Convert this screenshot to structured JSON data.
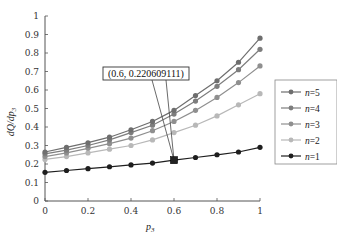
{
  "chart_data": {
    "type": "line",
    "title": "",
    "xlabel": "p3",
    "ylabel": "dQ/dp3",
    "xlim": [
      0,
      1
    ],
    "ylim": [
      0,
      1
    ],
    "x_ticks": [
      "0",
      "0.2",
      "0.4",
      "0.6",
      "0.8",
      "1"
    ],
    "y_ticks": [
      "0",
      "0.1",
      "0.2",
      "0.3",
      "0.4",
      "0.5",
      "0.6",
      "0.7",
      "0.8",
      "0.9",
      "1"
    ],
    "grid": false,
    "legend_position": "right",
    "x": [
      0,
      0.1,
      0.2,
      0.3,
      0.4,
      0.5,
      0.6,
      0.7,
      0.8,
      0.9,
      1.0
    ],
    "series": [
      {
        "name": "n=5",
        "color": "#6e6e6e",
        "values": [
          0.265,
          0.29,
          0.315,
          0.345,
          0.385,
          0.43,
          0.49,
          0.57,
          0.65,
          0.75,
          0.88
        ]
      },
      {
        "name": "n=4",
        "color": "#7d7d7d",
        "values": [
          0.255,
          0.275,
          0.3,
          0.33,
          0.37,
          0.41,
          0.47,
          0.54,
          0.62,
          0.71,
          0.82
        ]
      },
      {
        "name": "n=3",
        "color": "#8f8f8f",
        "values": [
          0.24,
          0.26,
          0.285,
          0.31,
          0.34,
          0.38,
          0.43,
          0.49,
          0.56,
          0.64,
          0.73
        ]
      },
      {
        "name": "n=2",
        "color": "#b8b8b8",
        "values": [
          0.225,
          0.24,
          0.26,
          0.28,
          0.3,
          0.33,
          0.37,
          0.41,
          0.46,
          0.52,
          0.58
        ]
      },
      {
        "name": "n=1",
        "color": "#1e1e1e",
        "values": [
          0.155,
          0.165,
          0.175,
          0.185,
          0.195,
          0.205,
          0.2206,
          0.235,
          0.25,
          0.265,
          0.29
        ]
      }
    ],
    "annotations": [
      {
        "text": "(0.6, 0.220609111)",
        "x": 0.6,
        "y": 0.220609111,
        "series": "n=1",
        "marker": "square"
      }
    ]
  },
  "legend": {
    "items": [
      {
        "label": "n=5",
        "n": "n",
        "eq": "=5"
      },
      {
        "label": "n=4",
        "n": "n",
        "eq": "=4"
      },
      {
        "label": "n=3",
        "n": "n",
        "eq": "=3"
      },
      {
        "label": "n=2",
        "n": "n",
        "eq": "=2"
      },
      {
        "label": "n=1",
        "n": "n",
        "eq": "=1"
      }
    ]
  },
  "axes": {
    "xlabel_main": "p",
    "xlabel_sub": "3",
    "ylabel_main": "dQ/dp",
    "ylabel_sub": "3"
  },
  "annotation_label": "(0.6, 0.220609111)"
}
